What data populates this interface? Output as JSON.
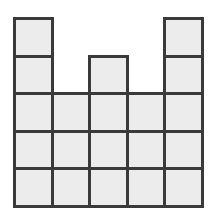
{
  "figure": {
    "column_heights": [
      5,
      3,
      4,
      3,
      5
    ],
    "columns": 5,
    "max_rows": 5,
    "total_squares": 20,
    "colors": {
      "fill": "#ececec",
      "stroke": "#3a3a3a",
      "background": "#ffffff"
    }
  }
}
